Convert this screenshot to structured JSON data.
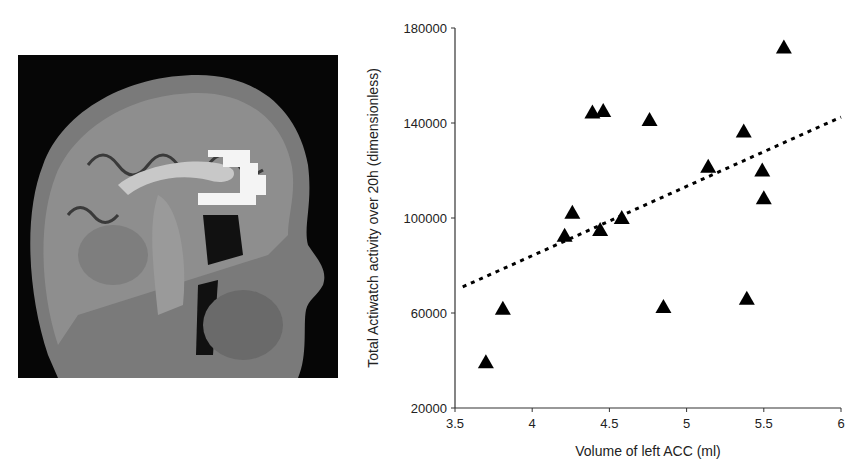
{
  "figure": {
    "left_panel": {
      "type": "image",
      "description": "Sagittal MRI brain scan with highlighted region of left anterior cingulate cortex (ACC)",
      "highlight_color": "#f4f4f4"
    }
  },
  "chart_data": {
    "type": "scatter",
    "title": "",
    "xlabel": "Volume of left ACC (ml)",
    "ylabel": "Total Actiwatch activity over 20h (dimensionless)",
    "xlim": [
      3.5,
      6
    ],
    "ylim": [
      20000,
      180000
    ],
    "x_ticks": [
      "3.5",
      "4",
      "4.5",
      "5",
      "5.5",
      "6"
    ],
    "y_ticks": [
      "20000",
      "60000",
      "100000",
      "140000",
      "180000"
    ],
    "grid": false,
    "legend": null,
    "marker": "triangle",
    "marker_color": "#000000",
    "series": [
      {
        "name": "subjects",
        "points": [
          {
            "x": 3.7,
            "y": 39300
          },
          {
            "x": 3.81,
            "y": 61800
          },
          {
            "x": 4.21,
            "y": 92500
          },
          {
            "x": 4.26,
            "y": 102200
          },
          {
            "x": 4.39,
            "y": 144400
          },
          {
            "x": 4.44,
            "y": 94900
          },
          {
            "x": 4.46,
            "y": 145100
          },
          {
            "x": 4.58,
            "y": 100000
          },
          {
            "x": 4.76,
            "y": 141300
          },
          {
            "x": 4.85,
            "y": 62500
          },
          {
            "x": 5.14,
            "y": 121600
          },
          {
            "x": 5.37,
            "y": 136400
          },
          {
            "x": 5.39,
            "y": 66000
          },
          {
            "x": 5.49,
            "y": 120000
          },
          {
            "x": 5.5,
            "y": 108300
          },
          {
            "x": 5.63,
            "y": 171800
          }
        ]
      }
    ],
    "trendline": {
      "style": "dotted",
      "color": "#000000",
      "from": {
        "x": 3.55,
        "y": 71000
      },
      "to": {
        "x": 6.0,
        "y": 142500
      }
    }
  }
}
